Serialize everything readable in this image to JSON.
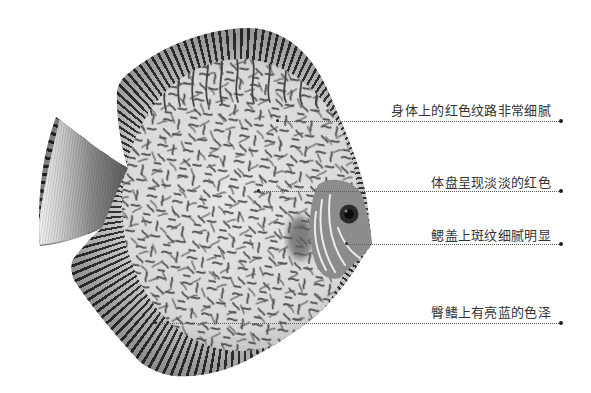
{
  "annotations": [
    {
      "label": "身体上的红色纹路非常细腻"
    },
    {
      "label": "体盘呈现淡淡的红色"
    },
    {
      "label": "鳃盖上斑纹细腻明显"
    },
    {
      "label": "臀鳍上有亮蓝的色泽"
    }
  ],
  "colors": {
    "background": "#ffffff",
    "label_text": "#333333",
    "leader_line": "#5a5a5a",
    "fish_body": "#d4d4d4",
    "fish_pattern": "#4a4a4a"
  }
}
